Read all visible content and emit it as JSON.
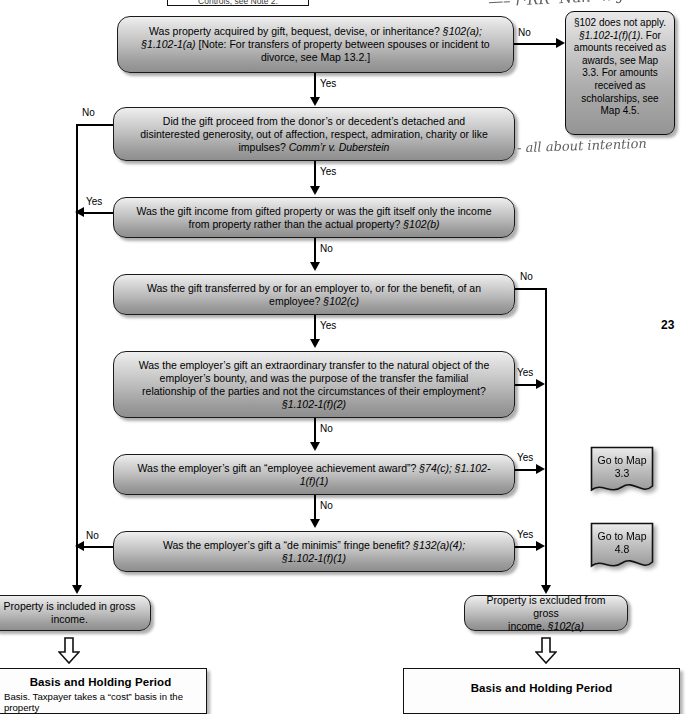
{
  "document": {
    "page_number": "23",
    "top_stub_text": "Controls, see Note 2."
  },
  "nodes": {
    "q1": {
      "name": "acquired-by-gift-question",
      "text_plain": "Was property acquired by gift, bequest, devise, or inheritance? §102(a); §1.102-1(a) [Note:  For transfers of property between spouses or incident to divorce, see Map 13.2.]",
      "lines": [
        {
          "parts": [
            {
              "t": "Was property acquired by gift, bequest, devise, or inheritance?  ",
              "i": false
            },
            {
              "t": "§102(a);",
              "i": true
            }
          ]
        },
        {
          "parts": [
            {
              "t": "§1.102-1(a)",
              "i": true
            },
            {
              "t": " [Note:  For transfers of property between spouses or incident to",
              "i": false
            }
          ]
        },
        {
          "parts": [
            {
              "t": "divorce, see Map 13.2.]",
              "i": false
            }
          ]
        }
      ]
    },
    "q2": {
      "name": "detached-disinterested-generosity-question",
      "text_plain": "Did the gift proceed from the donor's or decedent's detached and disinterested generosity, out of affection, respect, admiration, charity or like impulses?  Comm'r v. Duberstein",
      "lines": [
        {
          "parts": [
            {
              "t": "Did the gift proceed from the donor’s or decedent’s detached and",
              "i": false
            }
          ]
        },
        {
          "parts": [
            {
              "t": "disinterested generosity, out of affection, respect, admiration, charity or like",
              "i": false
            }
          ]
        },
        {
          "parts": [
            {
              "t": "impulses?  ",
              "i": false
            },
            {
              "t": "Comm’r v. Duberstein",
              "i": true
            }
          ]
        }
      ]
    },
    "q3": {
      "name": "gift-income-from-property-question",
      "text_plain": "Was the gift income from gifted property or was the gift itself only the income from property rather than the actual property?  §102(b)",
      "lines": [
        {
          "parts": [
            {
              "t": "Was the gift income from gifted property or was the gift itself only the income",
              "i": false
            }
          ]
        },
        {
          "parts": [
            {
              "t": "from property rather than the actual property?  ",
              "i": false
            },
            {
              "t": "§102(b)",
              "i": true
            }
          ]
        }
      ]
    },
    "q4": {
      "name": "employer-to-employee-transfer-question",
      "text_plain": "Was the gift transferred by or for an employer to, or for the benefit, of an employee? §102(c)",
      "lines": [
        {
          "parts": [
            {
              "t": "Was the gift transferred by or for an employer to, or for the benefit, of an",
              "i": false
            }
          ]
        },
        {
          "parts": [
            {
              "t": "employee? ",
              "i": false
            },
            {
              "t": "§102(c)",
              "i": true
            }
          ]
        }
      ]
    },
    "q5": {
      "name": "extraordinary-transfer-familial-question",
      "text_plain": "Was the employer's gift an extraordinary transfer to the natural object of the employer's bounty, and was the purpose of the transfer the familial relationship of the parties and not the circumstances of their employment? §1.102-1(f)(2)",
      "lines": [
        {
          "parts": [
            {
              "t": "Was the employer’s gift an extraordinary transfer to the natural object of the",
              "i": false
            }
          ]
        },
        {
          "parts": [
            {
              "t": "employer’s bounty, and was the purpose of the transfer the familial",
              "i": false
            }
          ]
        },
        {
          "parts": [
            {
              "t": "relationship of the parties and not the circumstances of their employment?",
              "i": false
            }
          ]
        },
        {
          "parts": [
            {
              "t": "§1.102-1(f)(2)",
              "i": true
            }
          ]
        }
      ]
    },
    "q6": {
      "name": "employee-achievement-award-question",
      "text_plain": "Was the employer's gift an “employee achievement award”? §74(c); §1.102-1(f)(1)",
      "lines": [
        {
          "parts": [
            {
              "t": "Was the employer’s gift an “employee achievement award”?  ",
              "i": false
            },
            {
              "t": "§74(c); §1.102-",
              "i": true
            }
          ]
        },
        {
          "parts": [
            {
              "t": "1(f)(1)",
              "i": true
            }
          ]
        }
      ]
    },
    "q7": {
      "name": "de-minimis-fringe-benefit-question",
      "text_plain": "Was the employer's gift a “de minimis” fringe benefit? §132(a)(4); §1.102-1(f)(1)",
      "lines": [
        {
          "parts": [
            {
              "t": "Was the employer’s gift a “de minimis” fringe benefit?  ",
              "i": false
            },
            {
              "t": "§132(a)(4);",
              "i": true
            }
          ]
        },
        {
          "parts": [
            {
              "t": "§1.102-1(f)(1)",
              "i": true
            }
          ]
        }
      ]
    },
    "included": {
      "name": "property-included-outcome",
      "text_plain": "Property is included in gross income.",
      "lines": [
        {
          "parts": [
            {
              "t": "Property is included in gross",
              "i": false
            }
          ]
        },
        {
          "parts": [
            {
              "t": "income.",
              "i": false
            }
          ]
        }
      ]
    },
    "excluded": {
      "name": "property-excluded-outcome",
      "text_plain": "Property is excluded from gross income. §102(a)",
      "lines": [
        {
          "parts": [
            {
              "t": "Property is excluded from gross",
              "i": false
            }
          ]
        },
        {
          "parts": [
            {
              "t": "income.  ",
              "i": false
            },
            {
              "t": "§102(a)",
              "i": true
            }
          ]
        }
      ]
    }
  },
  "note_box": {
    "name": "section-102-does-not-apply-note",
    "text_plain": "§102 does not apply. §1.102-1(f)(1).  For amounts received as awards, see Map 3.3.  For amounts received as scholarships, see Map 4.5.",
    "lines": [
      {
        "parts": [
          {
            "t": "§102 does not apply.",
            "i": false
          }
        ]
      },
      {
        "parts": [
          {
            "t": "§1.102-1(f)(1)",
            "i": true
          },
          {
            "t": ".  For",
            "i": false
          }
        ]
      },
      {
        "parts": [
          {
            "t": "amounts received as",
            "i": false
          }
        ]
      },
      {
        "parts": [
          {
            "t": "awards, see Map",
            "i": false
          }
        ]
      },
      {
        "parts": [
          {
            "t": "3.3.  For amounts",
            "i": false
          }
        ]
      },
      {
        "parts": [
          {
            "t": "received as",
            "i": false
          }
        ]
      },
      {
        "parts": [
          {
            "t": "scholarships, see",
            "i": false
          }
        ]
      },
      {
        "parts": [
          {
            "t": "Map 4.5.",
            "i": false
          }
        ]
      }
    ]
  },
  "map_refs": [
    {
      "name": "go-to-map-3-3",
      "line1": "Go to Map",
      "line2": "3.3"
    },
    {
      "name": "go-to-map-4-8",
      "line1": "Go to Map",
      "line2": "4.8"
    }
  ],
  "edge_labels": {
    "q1_no": "No",
    "q1_yes": "Yes",
    "q2_no": "No",
    "q2_yes": "Yes",
    "q3_yes": "Yes",
    "q3_no": "No",
    "q4_no": "No",
    "q4_yes": "Yes",
    "q5_yes": "Yes",
    "q5_no": "No",
    "q6_yes": "Yes",
    "q6_no": "No",
    "q7_no": "No",
    "q7_yes": "Yes"
  },
  "panels": {
    "left": {
      "name": "basis-and-holding-period-left",
      "title": "Basis and Holding Period",
      "body": "Basis.  Taxpayer takes a “cost” basis in the property"
    },
    "right": {
      "name": "basis-and-holding-period-right",
      "title": "Basis and Holding Period",
      "body": ""
    }
  },
  "annotations": {
    "intention_note": "- all about intention",
    "top_scribble": "—"
  },
  "colors": {
    "node_fill_top": "#efefef",
    "node_fill_bottom": "#8e8e8e",
    "stroke": "#1a1a1a",
    "panel_bg": "#fdfdfd",
    "handwriting": "#4a4a4a"
  }
}
